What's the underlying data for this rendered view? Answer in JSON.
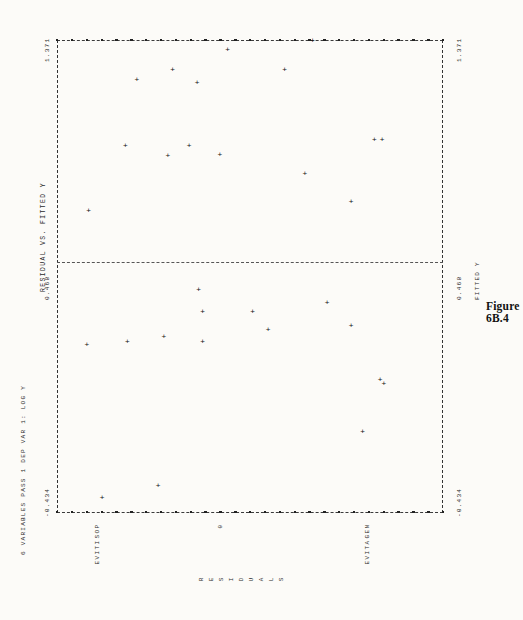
{
  "figure": {
    "caption": "Figure 6B.4",
    "plot_title": "RESIDUAL VS. FITTED Y",
    "header_line": "6 VARIABLES PASS 1  DEP VAR 1: LOG Y",
    "x_axis_label": "FITTED Y",
    "y_axis_label": "RESIDUALS",
    "category_positive": "POSITIVE",
    "category_zero": "0",
    "category_negative": "NEGATIVE"
  },
  "axis": {
    "tick_max": "1.371",
    "tick_mid": "0.468",
    "tick_min": "-0.434"
  },
  "chart_data": {
    "type": "scatter",
    "title": "RESIDUAL VS. FITTED Y",
    "subtitle": "6 VARIABLES PASS 1  DEP VAR 1: LOG Y",
    "xlabel": "FITTED Y",
    "ylabel": "RESIDUALS",
    "orientation": "rotated-90-lineprinter",
    "grid": false,
    "legend": null,
    "xlim": [
      -0.434,
      1.371
    ],
    "xticks": [
      -0.434,
      0.468,
      1.371
    ],
    "xticklabels": [
      "-0.434",
      "0.468",
      "1.371"
    ],
    "ylim": [
      -1.0,
      1.0
    ],
    "yticklabels": [
      "POSITIVE",
      "0",
      "NEGATIVE"
    ],
    "zero_reference_line": 0,
    "points": [
      {
        "fitted": 1.352,
        "residual": 0.33
      },
      {
        "fitted": 1.318,
        "residual": -0.11
      },
      {
        "fitted": 1.243,
        "residual": -0.395
      },
      {
        "fitted": 1.243,
        "residual": 0.185
      },
      {
        "fitted": 1.195,
        "residual": -0.268
      },
      {
        "fitted": 1.205,
        "residual": -0.58
      },
      {
        "fitted": 0.975,
        "residual": 0.65
      },
      {
        "fitted": 0.975,
        "residual": 0.69
      },
      {
        "fitted": 0.955,
        "residual": -0.31
      },
      {
        "fitted": 0.955,
        "residual": -0.64
      },
      {
        "fitted": 0.92,
        "residual": -0.15
      },
      {
        "fitted": 0.915,
        "residual": -0.42
      },
      {
        "fitted": 0.845,
        "residual": 0.29
      },
      {
        "fitted": 0.74,
        "residual": 0.53
      },
      {
        "fitted": 0.705,
        "residual": -0.83
      },
      {
        "fitted": 0.405,
        "residual": -0.26
      },
      {
        "fitted": 0.355,
        "residual": 0.405
      },
      {
        "fitted": 0.32,
        "residual": 0.02
      },
      {
        "fitted": 0.32,
        "residual": -0.24
      },
      {
        "fitted": 0.265,
        "residual": 0.53
      },
      {
        "fitted": 0.25,
        "residual": 0.1
      },
      {
        "fitted": 0.225,
        "residual": -0.44
      },
      {
        "fitted": 0.205,
        "residual": -0.24
      },
      {
        "fitted": 0.205,
        "residual": -0.63
      },
      {
        "fitted": 0.195,
        "residual": -0.84
      },
      {
        "fitted": 0.06,
        "residual": 0.68
      },
      {
        "fitted": 0.045,
        "residual": 0.7
      },
      {
        "fitted": -0.14,
        "residual": 0.59
      },
      {
        "fitted": -0.345,
        "residual": -0.47
      },
      {
        "fitted": -0.39,
        "residual": -0.76
      }
    ]
  }
}
